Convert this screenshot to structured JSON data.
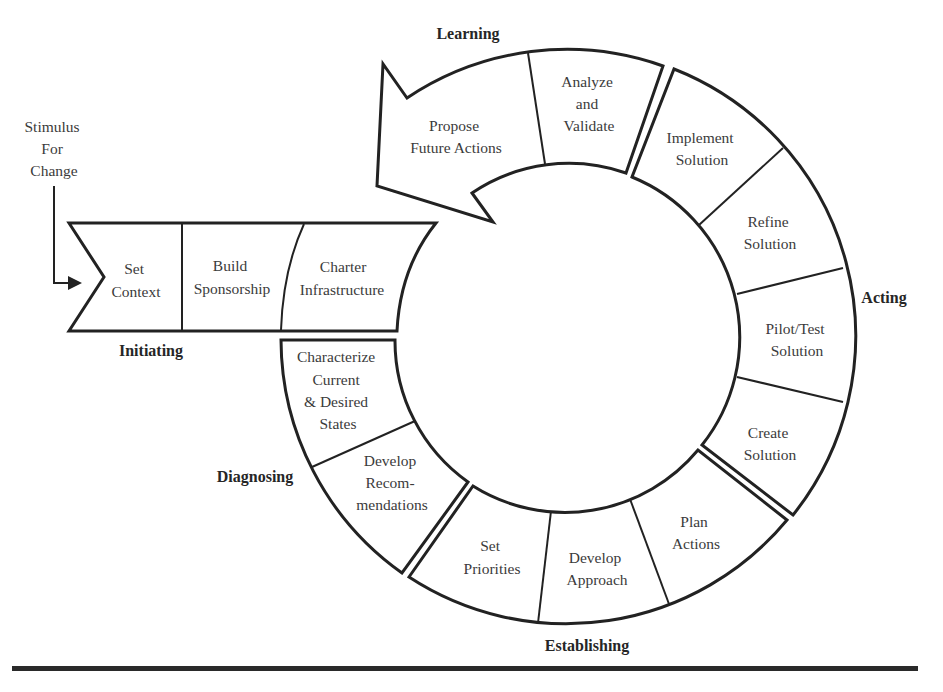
{
  "diagram": {
    "colors": {
      "stroke": "#222222",
      "text": "#3b3b3b",
      "phase_text": "#262626",
      "background": "#ffffff"
    },
    "stimulus": {
      "lines": [
        "Stimulus",
        "For",
        "Change"
      ],
      "icon": "arrow-right-icon"
    },
    "phases": {
      "initiating": {
        "label": "Initiating"
      },
      "diagnosing": {
        "label": "Diagnosing"
      },
      "establishing": {
        "label": "Establishing"
      },
      "acting": {
        "label": "Acting"
      },
      "learning": {
        "label": "Learning"
      }
    },
    "steps": {
      "set_context": {
        "lines": [
          "Set",
          "Context"
        ]
      },
      "build_sponsorship": {
        "lines": [
          "Build",
          "Sponsorship"
        ]
      },
      "charter_infrastructure": {
        "lines": [
          "Charter",
          "Infrastructure"
        ]
      },
      "characterize_states": {
        "lines": [
          "Characterize",
          "Current",
          "& Desired",
          "States"
        ]
      },
      "develop_recommendations": {
        "lines": [
          "Develop",
          "Recom-",
          "mendations"
        ]
      },
      "set_priorities": {
        "lines": [
          "Set",
          "Priorities"
        ]
      },
      "develop_approach": {
        "lines": [
          "Develop",
          "Approach"
        ]
      },
      "plan_actions": {
        "lines": [
          "Plan",
          "Actions"
        ]
      },
      "create_solution": {
        "lines": [
          "Create",
          "Solution"
        ]
      },
      "pilot_test_solution": {
        "lines": [
          "Pilot/Test",
          "Solution"
        ]
      },
      "refine_solution": {
        "lines": [
          "Refine",
          "Solution"
        ]
      },
      "implement_solution": {
        "lines": [
          "Implement",
          "Solution"
        ]
      },
      "analyze_validate": {
        "lines": [
          "Analyze",
          "and",
          "Validate"
        ]
      },
      "propose_future_actions": {
        "lines": [
          "Propose",
          "Future Actions"
        ]
      }
    }
  }
}
